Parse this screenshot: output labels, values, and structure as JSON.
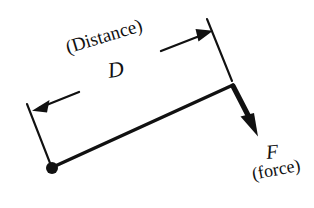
{
  "diagram": {
    "background_color": "#ffffff",
    "ink_color": "#111111",
    "labels": {
      "distance_caption": "(Distance)",
      "distance_symbol": "D",
      "force_symbol": "F",
      "force_caption": "(force)"
    },
    "elements": {
      "pivot_name": "pivot-point",
      "beam_name": "lever-beam",
      "force_arrow_name": "force-arrow",
      "dimension_left_arrow_name": "dimension-arrow-left",
      "dimension_right_arrow_name": "dimension-arrow-right",
      "extension_line_left_name": "extension-line-left",
      "extension_line_right_name": "extension-line-right"
    },
    "geometry": {
      "pivot": [
        52,
        168
      ],
      "beam_end": [
        233,
        85
      ],
      "pivot_dot_radius": 6,
      "beam_stroke_width": 3.4,
      "extension_line_left": [
        [
          27,
          104
        ],
        [
          50,
          163
        ]
      ],
      "extension_line_right": [
        [
          207,
          19
        ],
        [
          232,
          81
        ]
      ],
      "dimension_arrow_left": [
        [
          79,
          92
        ],
        [
          33,
          110
        ]
      ],
      "dimension_arrow_right": [
        [
          161,
          51
        ],
        [
          213,
          31
        ]
      ],
      "force_arrow": [
        [
          233,
          85
        ],
        [
          257,
          133
        ]
      ],
      "force_arrow_stroke_width": 5.2
    }
  }
}
